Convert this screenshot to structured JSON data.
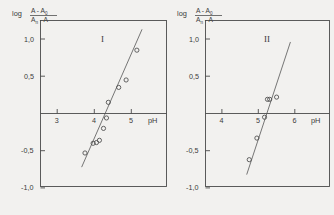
{
  "figure": {
    "background": "#f2f1ef",
    "ink": "#4a4a4a"
  },
  "chart_data": [
    {
      "type": "scatter",
      "title": "I",
      "xlabel": "pH",
      "ylabel": "log (A-A0)/(An-A)",
      "ylabel_parts": {
        "prefix": "log",
        "numerator": "A - A",
        "numerator_sub": "0",
        "denominator": "A",
        "denominator_sub": "n",
        "denominator_rest": " - A"
      },
      "xlim": [
        2.55,
        5.95
      ],
      "ylim": [
        -1.35,
        1.3
      ],
      "xticks": [
        3,
        4,
        5
      ],
      "xticklabels": [
        "3",
        "4",
        "5"
      ],
      "yticks": [
        1.0,
        0.5,
        -0.5,
        -1.0
      ],
      "yticklabels": [
        "1,0",
        "0,5",
        "-0,5",
        "-1,0"
      ],
      "grid": false,
      "legend": "none",
      "zero_line": true,
      "points": [
        {
          "x": 3.75,
          "y": -0.53
        },
        {
          "x": 3.97,
          "y": -0.4
        },
        {
          "x": 4.06,
          "y": -0.39
        },
        {
          "x": 4.14,
          "y": -0.36
        },
        {
          "x": 4.25,
          "y": -0.2
        },
        {
          "x": 4.33,
          "y": -0.06
        },
        {
          "x": 4.38,
          "y": 0.15
        },
        {
          "x": 4.66,
          "y": 0.35
        },
        {
          "x": 4.86,
          "y": 0.45
        },
        {
          "x": 5.15,
          "y": 0.85
        }
      ],
      "fit_line": {
        "x1": 3.66,
        "y1": -0.72,
        "x2": 5.29,
        "y2": 1.13
      }
    },
    {
      "type": "scatter",
      "title": "II",
      "xlabel": "pH",
      "ylabel": "log (A-A0)/(An-A)",
      "ylabel_parts": {
        "prefix": "log",
        "numerator": "A - A",
        "numerator_sub": "0",
        "denominator": "A",
        "denominator_sub": "n",
        "denominator_rest": " - A"
      },
      "xlim": [
        3.55,
        6.95
      ],
      "ylim": [
        -1.35,
        1.3
      ],
      "xticks": [
        4,
        5,
        6
      ],
      "xticklabels": [
        "4",
        "5",
        "6"
      ],
      "yticks": [
        1.0,
        0.5,
        -0.5,
        -1.0
      ],
      "yticklabels": [
        "1,0",
        "0,5",
        "-0,5",
        "-1,0"
      ],
      "grid": false,
      "legend": "none",
      "zero_line": true,
      "points": [
        {
          "x": 4.75,
          "y": -0.62
        },
        {
          "x": 4.96,
          "y": -0.33
        },
        {
          "x": 5.17,
          "y": -0.05
        },
        {
          "x": 5.25,
          "y": 0.19
        },
        {
          "x": 5.31,
          "y": 0.19
        },
        {
          "x": 5.5,
          "y": 0.22
        }
      ],
      "fit_line": {
        "x1": 4.68,
        "y1": -0.82,
        "x2": 5.88,
        "y2": 0.96
      }
    }
  ]
}
